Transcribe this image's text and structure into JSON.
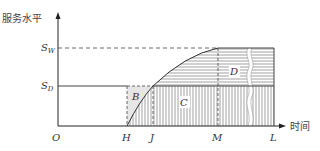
{
  "diagram": {
    "y_axis_label": "服务水平",
    "x_axis_label": "时间",
    "origin_label": "O",
    "levels": [
      {
        "main": "S",
        "sub": "W"
      },
      {
        "main": "S",
        "sub": "D"
      }
    ],
    "x_ticks": [
      "H",
      "J",
      "M",
      "L"
    ],
    "regions": [
      "B",
      "C",
      "D"
    ],
    "colors": {
      "axis": "#222222",
      "hatch": "#777777",
      "region_b_fill": "#e6e6e6",
      "dashed": "#444444"
    }
  }
}
